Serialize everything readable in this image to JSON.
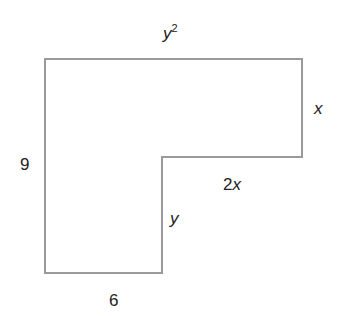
{
  "diagram": {
    "type": "L-shaped polygon",
    "stroke_color": "#9a9a9a",
    "labels": {
      "top": {
        "base": "y",
        "exponent": "2"
      },
      "right_upper": "x",
      "left": "9",
      "step_horizontal": "2x",
      "step_coef": "2",
      "step_var": "x",
      "step_vertical": "y",
      "bottom": "6"
    },
    "vertices": [
      [
        45,
        59
      ],
      [
        302,
        59
      ],
      [
        302,
        157
      ],
      [
        162,
        157
      ],
      [
        162,
        273
      ],
      [
        45,
        273
      ]
    ]
  }
}
